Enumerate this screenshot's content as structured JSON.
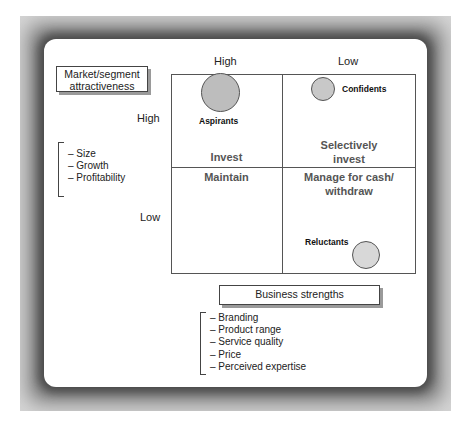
{
  "diagram": {
    "row_axis": {
      "title_lines": [
        "Market/segment",
        "attractiveness"
      ],
      "high_label": "High",
      "low_label": "Low",
      "factors": [
        "– Size",
        "– Growth",
        "– Profitability"
      ]
    },
    "column_axis": {
      "title": "Business strengths",
      "high_label": "High",
      "low_label": "Low",
      "factors": [
        "– Branding",
        "– Product range",
        "– Service quality",
        "– Price",
        "– Perceived expertise"
      ]
    },
    "quadrants": {
      "top_left": "Invest",
      "top_right_lines": [
        "Selectively",
        "invest"
      ],
      "bottom_left": "Maintain",
      "bottom_right_lines": [
        "Manage for cash/",
        "withdraw"
      ]
    },
    "segments": [
      {
        "name": "Aspirants",
        "quadrant": "High attractiveness / High strength",
        "size": "large",
        "fill": "#bdbdbd"
      },
      {
        "name": "Confidents",
        "quadrant": "High attractiveness / Low strength",
        "size": "small",
        "fill": "#c8c8c8"
      },
      {
        "name": "Reluctants",
        "quadrant": "Low attractiveness / Low strength",
        "size": "medium",
        "fill": "#d8d8d8"
      }
    ]
  }
}
